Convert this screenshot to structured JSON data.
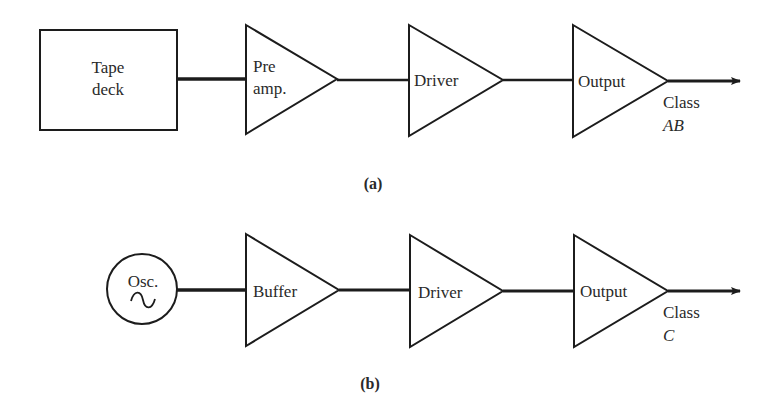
{
  "diagrams": [
    {
      "caption": "(a)",
      "source": {
        "shape": "box",
        "lines": [
          "Tape",
          "deck"
        ]
      },
      "stages": [
        {
          "shape": "triangle",
          "lines": [
            "Pre",
            "amp."
          ]
        },
        {
          "shape": "triangle",
          "lines": [
            "Driver"
          ]
        },
        {
          "shape": "triangle",
          "lines": [
            "Output"
          ]
        }
      ],
      "output_label": {
        "line1": "Class",
        "line2": "AB"
      }
    },
    {
      "caption": "(b)",
      "source": {
        "shape": "circle",
        "lines": [
          "Osc."
        ],
        "symbol": "~"
      },
      "stages": [
        {
          "shape": "triangle",
          "lines": [
            "Buffer"
          ]
        },
        {
          "shape": "triangle",
          "lines": [
            "Driver"
          ]
        },
        {
          "shape": "triangle",
          "lines": [
            "Output"
          ]
        }
      ],
      "output_label": {
        "line1": "Class",
        "line2": "C"
      }
    }
  ],
  "colors": {
    "ink": "#1c1c1c",
    "background": "#ffffff"
  }
}
